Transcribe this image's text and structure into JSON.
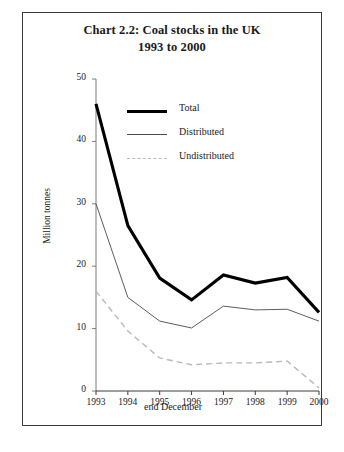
{
  "chart_data": {
    "type": "line",
    "title": "Chart 2.2:  Coal stocks in the UK",
    "subtitle": "1993 to 2000",
    "xlabel": "end December",
    "ylabel": "Million tonnes",
    "categories": [
      "1993",
      "1994",
      "1995",
      "1996",
      "1997",
      "1998",
      "1999",
      "2000"
    ],
    "x": [
      1993,
      1994,
      1995,
      1996,
      1997,
      1998,
      1999,
      2000
    ],
    "ylim": [
      0,
      50
    ],
    "yticks": [
      0,
      10,
      20,
      30,
      40,
      50
    ],
    "ytick_labels": [
      "0",
      "10",
      "20",
      "30",
      "40",
      "50"
    ],
    "grid": false,
    "legend_position": "upper-center",
    "series": [
      {
        "name": "Total",
        "style": "solid-thick",
        "color": "#000000",
        "values": [
          46.0,
          26.5,
          18.1,
          14.6,
          18.6,
          17.3,
          18.2,
          12.6
        ]
      },
      {
        "name": "Distributed",
        "style": "solid-thin",
        "color": "#4a4a4a",
        "values": [
          30.0,
          15.0,
          11.2,
          10.1,
          13.6,
          13.0,
          13.1,
          11.2
        ]
      },
      {
        "name": "Undistributed",
        "style": "dashed",
        "color": "#b9b9b9",
        "values": [
          16.0,
          9.6,
          5.3,
          4.2,
          4.5,
          4.5,
          4.8,
          0.5
        ]
      }
    ]
  },
  "figure": {
    "title_line1": "Chart 2.2:  Coal stocks in the UK",
    "title_line2": "1993 to 2000",
    "xlabel": "end December",
    "ylabel": "Million tonnes"
  },
  "legend": {
    "items": [
      {
        "label": "Total"
      },
      {
        "label": "Distributed"
      },
      {
        "label": "Undistributed"
      }
    ]
  }
}
